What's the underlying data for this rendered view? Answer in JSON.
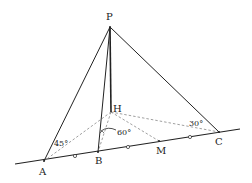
{
  "diagram": {
    "type": "geometry-3d-pyramid",
    "points": {
      "P": {
        "label": "P",
        "x": 110,
        "y": 27
      },
      "H": {
        "label": "H",
        "x": 111,
        "y": 112
      },
      "A": {
        "label": "A",
        "x": 44,
        "y": 161
      },
      "B": {
        "label": "B",
        "x": 98,
        "y": 152
      },
      "M": {
        "label": "M",
        "x": 159,
        "y": 141
      },
      "C": {
        "label": "C",
        "x": 219,
        "y": 132
      }
    },
    "base_line": {
      "x1": 15,
      "y1": 164,
      "x2": 240,
      "y2": 129
    },
    "tick_marks": [
      {
        "x": 75,
        "y": 156
      },
      {
        "x": 128,
        "y": 147
      },
      {
        "x": 190,
        "y": 137
      }
    ],
    "solid_segments": [
      [
        "P",
        "A"
      ],
      [
        "P",
        "B"
      ],
      [
        "P",
        "H"
      ],
      [
        "P",
        "C"
      ]
    ],
    "dashed_segments": [
      [
        "H",
        "A"
      ],
      [
        "H",
        "B"
      ],
      [
        "H",
        "M"
      ],
      [
        "H",
        "C"
      ]
    ],
    "angles": [
      {
        "label": "45°",
        "at": "A"
      },
      {
        "label": "60°",
        "at": "B"
      },
      {
        "label": "30°",
        "at": "C"
      }
    ],
    "colors": {
      "line": "#222222",
      "dashed": "#888888",
      "background": "#ffffff"
    }
  }
}
